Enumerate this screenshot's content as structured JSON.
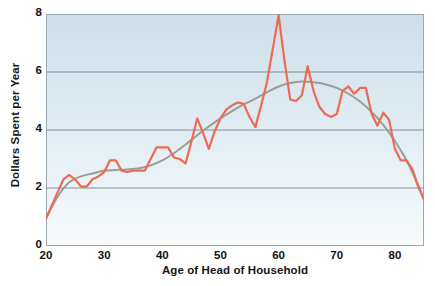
{
  "chart_data": {
    "type": "line",
    "title": "",
    "subtitle": "",
    "xlabel": "Age of Head of Household",
    "ylabel": "Dollars Spent per Year",
    "xlim": [
      20,
      85
    ],
    "ylim": [
      0,
      8
    ],
    "xticks": [
      20,
      30,
      40,
      50,
      60,
      70,
      80
    ],
    "yticks": [
      0,
      2,
      4,
      6,
      8
    ],
    "xtick_labels": [
      "20",
      "30",
      "40",
      "50",
      "60",
      "70",
      "80"
    ],
    "ytick_labels": [
      "0",
      "2",
      "4",
      "6",
      "8"
    ],
    "grid": "horizontal",
    "legend": "none",
    "annotations": [],
    "plot_background": {
      "gradient_top": "#cfdeea",
      "gradient_bottom": "#f6fafc",
      "border": "#9aa9b4"
    },
    "gridline_color": "#7f8f9c",
    "series": [
      {
        "name": "Dollars spent per year",
        "kind": "observed",
        "color": "#ec6b52",
        "width": 2.2,
        "x": [
          20,
          21,
          22,
          23,
          24,
          25,
          26,
          27,
          28,
          29,
          30,
          31,
          32,
          33,
          34,
          35,
          36,
          37,
          38,
          39,
          40,
          41,
          42,
          43,
          44,
          45,
          46,
          47,
          48,
          49,
          50,
          51,
          52,
          53,
          54,
          55,
          56,
          57,
          58,
          59,
          60,
          61,
          62,
          63,
          64,
          65,
          66,
          67,
          68,
          69,
          70,
          71,
          72,
          73,
          74,
          75,
          76,
          77,
          78,
          79,
          80,
          81,
          82,
          83,
          84,
          85
        ],
        "y": [
          0.95,
          1.4,
          1.85,
          2.3,
          2.45,
          2.3,
          2.05,
          2.05,
          2.3,
          2.4,
          2.55,
          2.95,
          2.95,
          2.6,
          2.55,
          2.6,
          2.6,
          2.6,
          3.0,
          3.4,
          3.4,
          3.4,
          3.05,
          3.0,
          2.85,
          3.6,
          4.4,
          3.9,
          3.35,
          3.95,
          4.4,
          4.7,
          4.85,
          4.95,
          4.9,
          4.45,
          4.1,
          4.85,
          5.65,
          6.8,
          7.95,
          6.4,
          5.05,
          5.0,
          5.2,
          6.2,
          5.35,
          4.8,
          4.55,
          4.45,
          4.55,
          5.35,
          5.5,
          5.25,
          5.45,
          5.45,
          4.55,
          4.15,
          4.6,
          4.35,
          3.35,
          2.95,
          2.95,
          2.65,
          2.05,
          1.6
        ]
      },
      {
        "name": "Smoothed trend",
        "kind": "trend",
        "color": "#9a9e9b",
        "width": 2.0,
        "x": [
          20,
          22,
          24,
          26,
          28,
          30,
          32,
          34,
          36,
          38,
          40,
          42,
          44,
          46,
          48,
          50,
          52,
          54,
          56,
          58,
          60,
          62,
          64,
          66,
          68,
          70,
          72,
          74,
          76,
          78,
          80,
          82,
          84,
          85
        ],
        "y": [
          0.95,
          1.7,
          2.2,
          2.4,
          2.5,
          2.6,
          2.62,
          2.64,
          2.68,
          2.78,
          2.95,
          3.2,
          3.5,
          3.82,
          4.12,
          4.4,
          4.65,
          4.88,
          5.08,
          5.3,
          5.5,
          5.62,
          5.67,
          5.65,
          5.58,
          5.45,
          5.25,
          4.98,
          4.62,
          4.18,
          3.62,
          2.95,
          2.1,
          1.6
        ]
      }
    ]
  },
  "axis": {
    "ylabel_text": "Dollars Spent per Year",
    "xlabel_text": "Age of Head of Household"
  }
}
